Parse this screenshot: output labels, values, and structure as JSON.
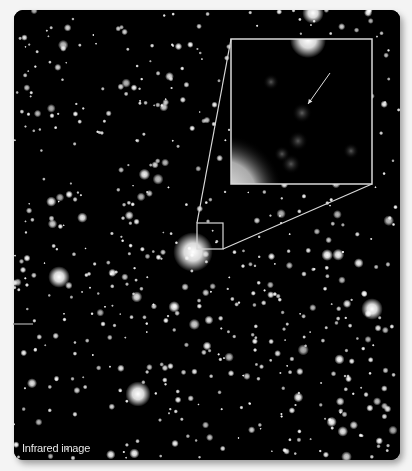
{
  "figure": {
    "label": "Infrared image",
    "colors": {
      "background": "#f4f4f4",
      "sky": "#000000",
      "star": "#ffffff",
      "callout": "#d8d8d8"
    },
    "starfield": {
      "seed": 7,
      "count": 620
    },
    "notable_objects": [
      {
        "name": "bright-galaxy-center",
        "x": 193,
        "y": 252,
        "r": 11
      },
      {
        "name": "galaxy-lower-middle",
        "x": 138,
        "y": 394,
        "r": 7
      },
      {
        "name": "galaxy-left-middle",
        "x": 59,
        "y": 277,
        "r": 6
      },
      {
        "name": "galaxy-right",
        "x": 372,
        "y": 309,
        "r": 6
      },
      {
        "name": "galaxy-top",
        "x": 313,
        "y": 13,
        "r": 6
      }
    ],
    "selection_box": {
      "x": 197,
      "y": 223,
      "w": 26,
      "h": 26
    },
    "inset": {
      "x": 231,
      "y": 39,
      "w": 141,
      "h": 145,
      "arrow": {
        "x1": 330,
        "y1": 73,
        "x2": 308,
        "y2": 104
      },
      "target": {
        "x": 302,
        "y": 113,
        "r": 5
      },
      "blobs": [
        {
          "x": 271,
          "y": 82,
          "r": 4
        },
        {
          "x": 298,
          "y": 141,
          "r": 5
        },
        {
          "x": 282,
          "y": 154,
          "r": 4
        },
        {
          "x": 291,
          "y": 164,
          "r": 5
        },
        {
          "x": 351,
          "y": 151,
          "r": 4
        }
      ]
    }
  }
}
